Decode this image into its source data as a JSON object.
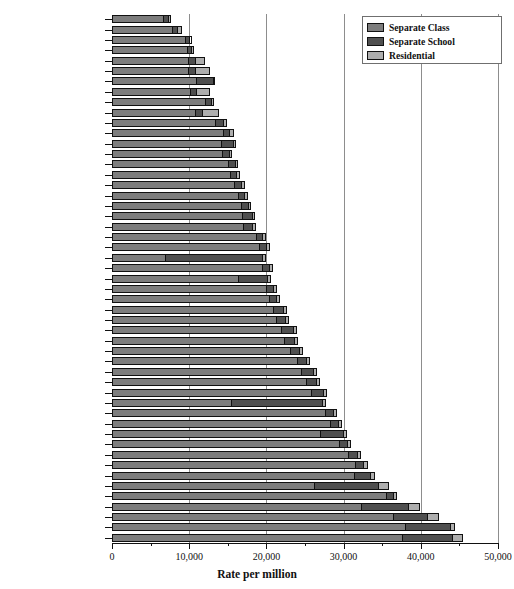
{
  "chart_data": {
    "type": "bar",
    "orientation": "horizontal",
    "stacked": true,
    "title": "",
    "xlabel": "Rate per million",
    "ylabel": "",
    "xlim": [
      0,
      50000
    ],
    "xticks": [
      0,
      10000,
      20000,
      30000,
      40000,
      50000
    ],
    "xticklabels": [
      "0",
      "10,000",
      "20,000",
      "30,000",
      "40,000",
      "50,000"
    ],
    "xminorticks": [
      5000,
      15000,
      25000,
      35000,
      45000
    ],
    "grid": "vertical-major",
    "legend_position": "top-right",
    "categories": [
      "Oregon",
      "Nebraska",
      "Idaho",
      "Oklahoma",
      "South Dakota",
      "Wyoming",
      "Nevada",
      "North Dakota",
      "Texas",
      "Vermont",
      "Hawaii",
      "Montana",
      "Utah",
      "Arkansas",
      "Colorado",
      "New Mexico",
      "Washington",
      "North Carolina",
      "Kentucky",
      "Minnesota",
      "Alaska",
      "New Hampshire",
      "Wisconsin",
      "District of Columbia",
      "Mississippi",
      "Tennessee",
      "Arizona",
      "Georgia",
      "Kansas",
      "Michigan",
      "Maine",
      "California",
      "South Carolina",
      "West Virginia",
      "Missouri",
      "Louisiana",
      "Alabama",
      "Delaware",
      "Florida",
      "Indiana",
      "Massachusetts",
      "Virginia",
      "Iowa",
      "Rhode Island",
      "Pennsylvania",
      "Ohio",
      "Illinois",
      "Connecticut",
      "Maryland",
      "New Jersey",
      "New York"
    ],
    "series": [
      {
        "name": "Separate Class",
        "color": "#7d7d7d",
        "values": [
          6700,
          7900,
          9600,
          9800,
          9900,
          9900,
          10900,
          10200,
          12100,
          10800,
          13500,
          14500,
          14200,
          14300,
          15200,
          15400,
          15900,
          16400,
          16800,
          17000,
          17100,
          18800,
          19200,
          6800,
          19600,
          16400,
          20100,
          20400,
          21000,
          21300,
          22000,
          22400,
          23200,
          24100,
          24600,
          25300,
          25900,
          15400,
          27700,
          28300,
          27100,
          29500,
          30700,
          31600,
          31400,
          26200,
          35600,
          32300,
          36500,
          38000,
          37700
        ]
      },
      {
        "name": "Separate School",
        "color": "#4f4f4f",
        "values": [
          700,
          600,
          500,
          600,
          900,
          900,
          2300,
          800,
          900,
          1000,
          1000,
          800,
          1600,
          1000,
          800,
          800,
          900,
          800,
          900,
          1200,
          1100,
          800,
          900,
          12700,
          900,
          3800,
          900,
          1000,
          1300,
          1200,
          1600,
          1300,
          1200,
          1200,
          1500,
          1300,
          1600,
          11900,
          1100,
          1100,
          2900,
          1100,
          1200,
          1100,
          2200,
          8400,
          900,
          6200,
          4400,
          5900,
          6500
        ]
      },
      {
        "name": "Residential",
        "color": "#aeaeae",
        "values": [
          200,
          600,
          200,
          200,
          1300,
          1900,
          200,
          1700,
          200,
          2000,
          400,
          500,
          300,
          300,
          300,
          400,
          400,
          400,
          300,
          300,
          400,
          400,
          400,
          400,
          400,
          400,
          400,
          400,
          400,
          400,
          400,
          400,
          400,
          400,
          400,
          400,
          400,
          400,
          400,
          400,
          400,
          400,
          400,
          400,
          500,
          1300,
          400,
          1400,
          1400,
          500,
          1300
        ]
      }
    ]
  },
  "legend": {
    "items": [
      {
        "label": "Separate Class",
        "color": "#7d7d7d"
      },
      {
        "label": "Separate School",
        "color": "#4f4f4f"
      },
      {
        "label": "Residential",
        "color": "#aeaeae"
      }
    ]
  }
}
